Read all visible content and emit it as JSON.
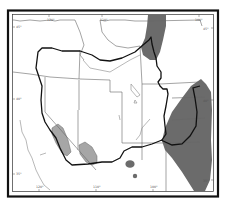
{
  "map": {
    "title": "",
    "region": "Western United States",
    "colors": {
      "background": "#ffffff",
      "frame": "#111111",
      "state_borders": "#666666",
      "range_outline": "#111111",
      "dark_shading": "#6b6b6b",
      "light_shading": "#a6a6a6",
      "coastline_rivers": "#888888"
    },
    "tick_labels": {
      "top": [
        "120°",
        "110°",
        "100°"
      ],
      "left": [
        "45°",
        "40°",
        "35°"
      ],
      "bottom": [
        "120°",
        "110°",
        "100°"
      ],
      "right": [
        "45°",
        "40°",
        "35°"
      ]
    }
  }
}
